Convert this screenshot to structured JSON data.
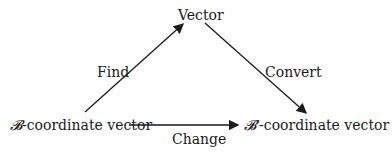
{
  "diagram": {
    "nodes": {
      "top": "Vector",
      "left_symbol": "𝓑",
      "left_text": "-coordinate vector",
      "right_symbol": "𝓑′",
      "right_text": "-coordinate vector"
    },
    "edges": {
      "left_to_top": "Find",
      "top_to_right": "Convert",
      "left_to_right": "Change"
    },
    "colors": {
      "line": "#1a1a1a",
      "background": "#ffffff"
    }
  }
}
